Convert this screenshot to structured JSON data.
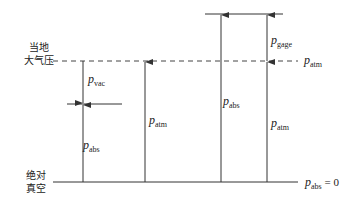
{
  "diagram": {
    "title": "",
    "left_labels": {
      "atmosphere_line_1": "当地",
      "atmosphere_line_2": "大气压",
      "vacuum_line_1": "绝对",
      "vacuum_line_2": "真空"
    },
    "right_labels": {
      "atm": {
        "p": "p",
        "sub": "atm",
        "suffix": ""
      },
      "zero": {
        "p": "p",
        "sub": "abs",
        "suffix": " = 0"
      }
    },
    "arrow_labels": {
      "vac": {
        "p": "p",
        "sub": "vac"
      },
      "abs_low": {
        "p": "p",
        "sub": "abs"
      },
      "atm_mid": {
        "p": "p",
        "sub": "atm"
      },
      "abs_high": {
        "p": "p",
        "sub": "abs"
      },
      "gage": {
        "p": "p",
        "sub": "gage"
      },
      "atm_right": {
        "p": "p",
        "sub": "atm"
      }
    },
    "colors": {
      "line": "#333333",
      "background": "#ffffff"
    }
  }
}
